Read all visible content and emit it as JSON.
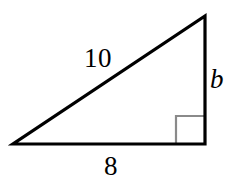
{
  "figure": {
    "kind": "right-triangle-diagram",
    "canvas": {
      "width": 236,
      "height": 186
    },
    "background_color": "#ffffff",
    "stroke_color": "#000000",
    "stroke_width": 3,
    "right_angle_marker": {
      "present": true,
      "color": "#8a8a8a",
      "size": 29,
      "corner": "bottom-right"
    },
    "vertices": {
      "left": {
        "x": 13,
        "y": 144
      },
      "bottom_right": {
        "x": 205,
        "y": 144
      },
      "apex": {
        "x": 205,
        "y": 16
      }
    },
    "sides": [
      {
        "name": "hypotenuse",
        "label": "10",
        "label_style": "upright",
        "from": "left",
        "to": "apex"
      },
      {
        "name": "vertical-leg",
        "label": "b",
        "label_style": "italic",
        "from": "apex",
        "to": "bottom_right"
      },
      {
        "name": "base-leg",
        "label": "8",
        "label_style": "upright",
        "from": "left",
        "to": "bottom_right"
      }
    ],
    "labels": {
      "hypotenuse": "10",
      "vertical": "b",
      "base": "8"
    }
  }
}
